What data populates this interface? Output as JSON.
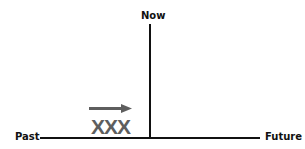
{
  "diagram": {
    "labels": {
      "now": "Now",
      "past": "Past",
      "future": "Future"
    },
    "marker": {
      "text": "XXX",
      "arrow_direction": "right",
      "color": "#5e5e5e"
    },
    "line_color": "#111111"
  }
}
